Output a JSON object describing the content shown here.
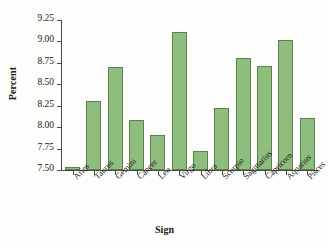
{
  "chart_data": {
    "type": "bar",
    "title": "",
    "xlabel": "Sign",
    "ylabel": "Percent",
    "categories": [
      "Aries",
      "Taurus",
      "Gemini",
      "Cancer",
      "Leo",
      "Virgo",
      "Libra",
      "Scorpio",
      "Sagittarius",
      "Capricorn",
      "Aquarius",
      "Pisces"
    ],
    "values": [
      7.54,
      8.3,
      8.7,
      8.08,
      7.91,
      9.11,
      7.72,
      8.22,
      8.81,
      8.71,
      9.02,
      8.11
    ],
    "ylim": [
      7.5,
      9.25
    ],
    "yticks": [
      "7.50",
      "7.75",
      "8.00",
      "8.25",
      "8.50",
      "8.75",
      "9.00",
      "9.25"
    ],
    "ytick_values": [
      7.5,
      7.75,
      8.0,
      8.25,
      8.5,
      8.75,
      9.0,
      9.25
    ],
    "grid": false,
    "legend": "none",
    "bar_fill_color": "#8fbd7e",
    "bar_edge_color": "#5d7e4f",
    "axis_color": "#4a4a46",
    "background_color": "#fdfdfb"
  }
}
